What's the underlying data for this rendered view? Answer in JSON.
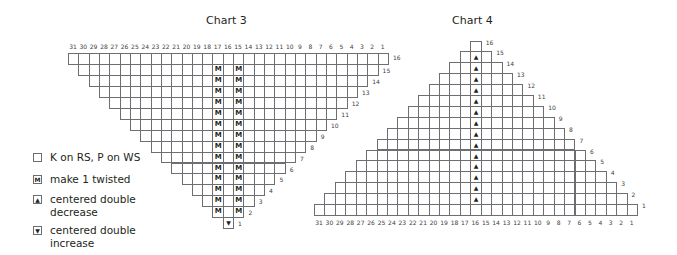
{
  "chart3": {
    "title": "Chart 3",
    "columns": [
      31,
      30,
      29,
      28,
      27,
      26,
      25,
      24,
      23,
      22,
      21,
      20,
      19,
      18,
      17,
      16,
      15,
      14,
      13,
      12,
      11,
      10,
      9,
      8,
      7,
      6,
      5,
      4,
      3,
      2,
      1
    ],
    "rows": 16,
    "shape": "inverted-triangle",
    "symbols": {
      "make1_columns": [
        17,
        15
      ],
      "make1_rows": [
        2,
        3,
        4,
        5,
        6,
        7,
        8,
        9,
        10,
        11,
        12,
        13,
        14,
        15
      ],
      "increase_cell": {
        "row": 1,
        "column": 16
      }
    }
  },
  "chart4": {
    "title": "Chart 4",
    "columns": [
      31,
      30,
      29,
      28,
      27,
      26,
      25,
      24,
      23,
      22,
      21,
      20,
      19,
      18,
      17,
      16,
      15,
      14,
      13,
      12,
      11,
      10,
      9,
      8,
      7,
      6,
      5,
      4,
      3,
      2,
      1
    ],
    "rows": 16,
    "shape": "triangle",
    "symbols": {
      "decrease_column": 16,
      "decrease_rows": [
        2,
        3,
        4,
        5,
        6,
        7,
        8,
        9,
        10,
        11,
        12,
        13,
        14,
        15
      ]
    }
  },
  "legend": {
    "items": [
      {
        "symbol": "",
        "icon": "empty-square-icon",
        "label": "K on RS, P on WS"
      },
      {
        "symbol": "M",
        "icon": "make-one-icon",
        "label": "make 1 twisted"
      },
      {
        "symbol": "▲",
        "icon": "decrease-arrow-icon",
        "label": "centered double decrease"
      },
      {
        "symbol": "▼",
        "icon": "increase-arrow-icon",
        "label": "centered double increase"
      }
    ]
  },
  "colors": {
    "grid": "#6d6e71",
    "text": "#231f20"
  }
}
